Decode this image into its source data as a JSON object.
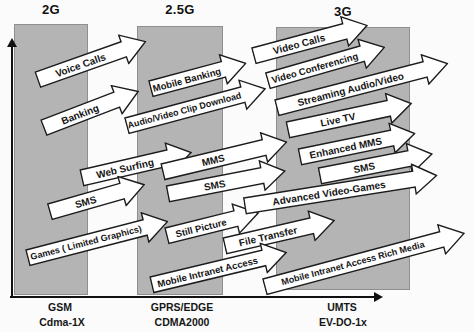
{
  "generations": [
    {
      "label": "2G",
      "tech_primary": "GSM",
      "tech_secondary": "Cdma-1X"
    },
    {
      "label": "2.5G",
      "tech_primary": "GPRS/EDGE",
      "tech_secondary": "CDMA2000"
    },
    {
      "label": "3G",
      "tech_primary": "UMTS",
      "tech_secondary": "EV-DO-1x"
    }
  ],
  "arrows": [
    {
      "label": "Voice Calls",
      "from": "2G",
      "to": "2.5G"
    },
    {
      "label": "Banking",
      "from": "2G",
      "to": "2.5G"
    },
    {
      "label": "Mobile Banking",
      "from": "2.5G",
      "to": "3G"
    },
    {
      "label": "Audio/Video Clip Download",
      "from": "2.5G",
      "to": "3G"
    },
    {
      "label": "Video Calls",
      "from": "3G",
      "to": "3G"
    },
    {
      "label": "Video Conferencing",
      "from": "3G",
      "to": "3G"
    },
    {
      "label": "Streaming Audio/Video",
      "from": "3G",
      "to": "3G"
    },
    {
      "label": "Live TV",
      "from": "3G",
      "to": "3G"
    },
    {
      "label": "Web Surfing",
      "from": "2G",
      "to": "2.5G"
    },
    {
      "label": "MMS",
      "from": "2.5G",
      "to": "3G"
    },
    {
      "label": "SMS",
      "from": "2.5G",
      "to": "3G"
    },
    {
      "label": "Enhanced MMS",
      "from": "3G",
      "to": "3G"
    },
    {
      "label": "SMS",
      "from": "3G",
      "to": "3G"
    },
    {
      "label": "SMS",
      "from": "2G",
      "to": "2.5G"
    },
    {
      "label": "Games ( Limited Graphics)",
      "from": "2G",
      "to": "2.5G"
    },
    {
      "label": "Still Picture",
      "from": "2.5G",
      "to": "3G"
    },
    {
      "label": "Advanced Video-Games",
      "from": "2.5G",
      "to": "3G"
    },
    {
      "label": "File Transfer",
      "from": "2.5G",
      "to": "3G"
    },
    {
      "label": "Mobile Intranet Access",
      "from": "2.5G",
      "to": "3G"
    },
    {
      "label": "Mobile Intranet Access Rich Media",
      "from": "3G",
      "to": "3G"
    }
  ],
  "colors": {
    "background": "#fbfbfb",
    "column_fill": "#b4b4b4",
    "column_border": "#8f8f8f",
    "arrow_fill": "#ffffff",
    "arrow_outline": "#1c1c1c",
    "axis": "#111111",
    "text": "#111111"
  }
}
